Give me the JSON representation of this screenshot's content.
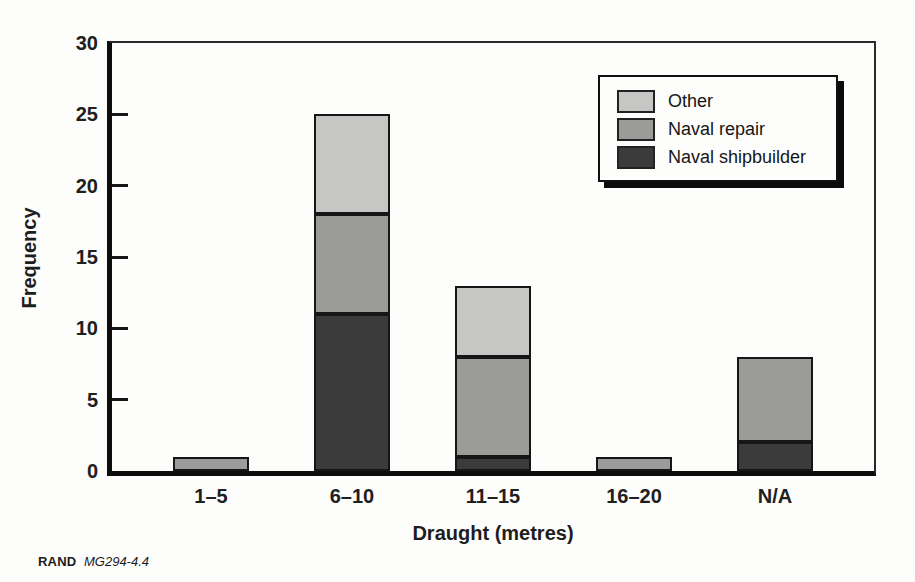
{
  "page": {
    "background": "#fdfdfc",
    "footer": {
      "brand": "RAND",
      "doc_id": "MG294-4.4"
    }
  },
  "chart_data": {
    "type": "bar",
    "stacked": true,
    "title": "",
    "xlabel": "Draught (metres)",
    "ylabel": "Frequency",
    "categories": [
      "1–5",
      "6–10",
      "11–15",
      "16–20",
      "N/A"
    ],
    "series": [
      {
        "name": "Naval shipbuilder",
        "color": "#3b3b3b",
        "values": [
          0,
          11,
          1,
          0,
          2
        ]
      },
      {
        "name": "Naval repair",
        "color": "#9b9c9a",
        "values": [
          1,
          7,
          7,
          1,
          6
        ]
      },
      {
        "name": "Other",
        "color": "#c6c7c5",
        "values": [
          0,
          7,
          5,
          0,
          0
        ]
      }
    ],
    "totals": [
      1,
      25,
      13,
      1,
      8
    ],
    "ylim": [
      0,
      30
    ],
    "yticks": [
      0,
      5,
      10,
      15,
      20,
      25,
      30
    ],
    "grid": false,
    "legend": {
      "position": "top-right",
      "order": [
        "Other",
        "Naval repair",
        "Naval shipbuilder"
      ]
    }
  }
}
